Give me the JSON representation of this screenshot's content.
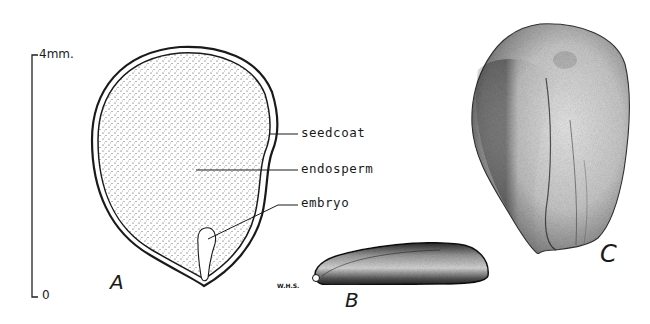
{
  "scale_bar": {
    "top_label": "4mm.",
    "bottom_label": "0"
  },
  "figure_a": {
    "letter": "A",
    "callouts": [
      {
        "label": "seedcoat"
      },
      {
        "label": "endosperm"
      },
      {
        "label": "embryo"
      }
    ]
  },
  "figure_b": {
    "letter": "B",
    "signature": "W.H.S."
  },
  "figure_c": {
    "letter": "C"
  },
  "colors": {
    "ink": "#1a1a1a",
    "background": "#ffffff"
  }
}
